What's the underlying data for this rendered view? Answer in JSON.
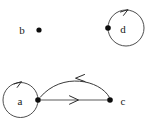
{
  "figure": {
    "kind": "directed-graph-diagram",
    "background_color": "#ffffff",
    "width": 153,
    "height": 127
  },
  "nodes": [
    {
      "id": "b",
      "label": "b",
      "dot_x": 39,
      "dot_y": 30,
      "label_x": 22,
      "label_y": 30,
      "label_side": "left",
      "has_self_loop": false
    },
    {
      "id": "d",
      "label": "d",
      "dot_x": 108,
      "dot_y": 28,
      "label_x": 123,
      "label_y": 29,
      "label_side": "right-inside-loop",
      "has_self_loop": true,
      "loop_center_x": 126,
      "loop_center_y": 28,
      "loop_radius": 18,
      "loop_arrow_x": 127,
      "loop_arrow_y": 10,
      "loop_arrow_direction": "right"
    },
    {
      "id": "a",
      "label": "a",
      "dot_x": 38,
      "dot_y": 100,
      "label_x": 20,
      "label_y": 101,
      "label_side": "left-inside-loop",
      "has_self_loop": true,
      "loop_center_x": 20,
      "loop_center_y": 100,
      "loop_radius": 17.5,
      "loop_arrow_x": 20,
      "loop_arrow_y": 82,
      "loop_arrow_direction": "right"
    },
    {
      "id": "c",
      "label": "c",
      "dot_x": 110,
      "dot_y": 100,
      "label_x": 123,
      "label_y": 101,
      "label_side": "right",
      "has_self_loop": false
    }
  ],
  "edges": [
    {
      "id": "a-to-c",
      "from": "a",
      "to": "c",
      "shape": "straight",
      "color": "#5a5a5a",
      "arrow_direction": "right",
      "arrow_x": 76,
      "arrow_y": 100,
      "path": "M 40 100 L 108 100"
    },
    {
      "id": "c-to-a",
      "from": "c",
      "to": "a",
      "shape": "arc",
      "color": "#3a3a3a",
      "arrow_direction": "left",
      "arrow_x": 79,
      "arrow_y": 79,
      "path": "M 109 98 C 98 80 60 72 40 98"
    }
  ],
  "colors": {
    "stroke": "#3a3a3a",
    "stroke_gray": "#5a5a5a",
    "node_fill": "#0d0d0d",
    "label_fill": "#1a1a1a",
    "background": "#ffffff"
  }
}
